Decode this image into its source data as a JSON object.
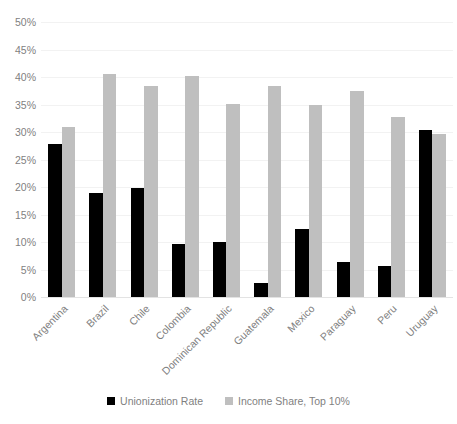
{
  "chart_data": {
    "type": "bar",
    "title": "",
    "subtitle": "",
    "xlabel": "",
    "ylabel": "",
    "ylim": [
      0,
      50
    ],
    "ytick_labels": [
      "50%",
      "45%",
      "40%",
      "35%",
      "30%",
      "25%",
      "20%",
      "15%",
      "10%",
      "5%",
      "0%"
    ],
    "ytick_values": [
      50,
      45,
      40,
      35,
      30,
      25,
      20,
      15,
      10,
      5,
      0
    ],
    "grid": true,
    "legend_position": "bottom",
    "categories": [
      "Argentina",
      "Brazil",
      "Chile",
      "Colombia",
      "Dominican Republic",
      "Guatemala",
      "Mexico",
      "Paraguay",
      "Peru",
      "Uruguay"
    ],
    "series": [
      {
        "name": "Unionization Rate",
        "color": "#000000",
        "values": [
          27.8,
          18.9,
          19.8,
          9.6,
          10.0,
          2.5,
          12.4,
          6.4,
          5.6,
          30.3
        ]
      },
      {
        "name": "Income Share, Top 10%",
        "color": "#bfbfbf",
        "values": [
          30.9,
          40.5,
          38.3,
          40.1,
          35.1,
          38.4,
          35.0,
          37.5,
          32.8,
          29.7
        ]
      }
    ]
  },
  "legend": {
    "items": [
      {
        "label": "Unionization Rate",
        "color": "#000000",
        "swatch_name": "legend-swatch-unionization-rate"
      },
      {
        "label": "Income Share, Top 10%",
        "color": "#bfbfbf",
        "swatch_name": "legend-swatch-income-share"
      }
    ]
  },
  "colors": {
    "series_0": "#000000",
    "series_1": "#bfbfbf",
    "axis_text": "#7f7f7f",
    "gridline": "#f2f2f2",
    "background": "#ffffff"
  }
}
